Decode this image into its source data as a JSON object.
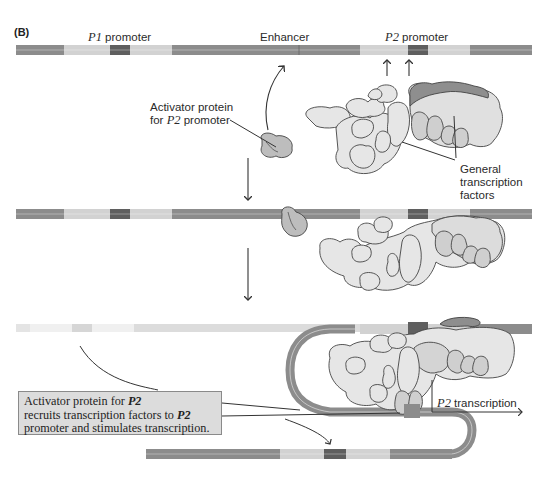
{
  "panel_label": "(B)",
  "labels": {
    "p1_promoter_italic": "P1",
    "p1_promoter_text": " promoter",
    "enhancer": "Enhancer",
    "p2_promoter_italic": "P2",
    "p2_promoter_text": " promoter",
    "activator_line1": "Activator protein",
    "activator_line2_pre": "for ",
    "activator_line2_italic": "P2",
    "activator_line2_post": " promoter",
    "gtf_line1": "General",
    "gtf_line2": "transcription",
    "gtf_line3": "factors",
    "p2_transcription_italic": "P2",
    "p2_transcription_text": " transcription"
  },
  "callout": {
    "line1_pre": "Activator protein for ",
    "line1_italic": "P2",
    "line2_pre": "recruits transcription factors to ",
    "line2_italic": "P2",
    "line3": "promoter and stimulates transcription."
  },
  "colors": {
    "dna_dark": "#8c8c8c",
    "dna_light": "#d2d2d2",
    "promoter_box": "#5f5f5f",
    "protein_fill": "#e6e6e6",
    "protein_mid": "#c8c8c8",
    "activator_fill": "#bdbdbd",
    "rna_pol_cap": "#8e8e8e",
    "callout_bg": "#dcdcdc"
  },
  "steps": [
    {
      "name": "unbound",
      "description": "Activator and general transcription factors free in solution"
    },
    {
      "name": "activator-bound",
      "description": "Activator bound at enhancer, factors assembled near P2"
    },
    {
      "name": "dna-looping",
      "description": "DNA loops so activator at enhancer recruits factors to P2 promoter"
    }
  ]
}
